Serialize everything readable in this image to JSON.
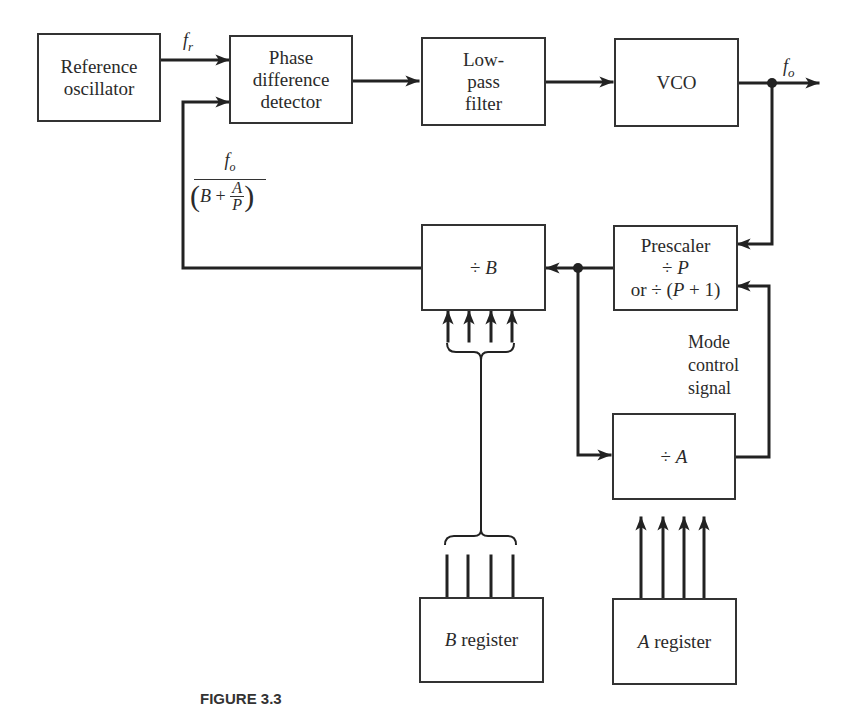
{
  "diagram": {
    "type": "block-diagram",
    "blocks": {
      "reference_oscillator": {
        "label_line1": "Reference",
        "label_line2": "oscillator"
      },
      "phase_detector": {
        "label_line1": "Phase",
        "label_line2": "difference",
        "label_line3": "detector"
      },
      "low_pass_filter": {
        "label_line1": "Low-",
        "label_line2": "pass",
        "label_line3": "filter"
      },
      "vco": {
        "label": "VCO"
      },
      "prescaler": {
        "label_line1": "Prescaler",
        "label_line2_op": "÷",
        "label_line2_var": "P",
        "label_line3_prefix": "or ÷ (",
        "label_line3_var": "P",
        "label_line3_suffix": " + 1)"
      },
      "divide_b": {
        "op": "÷",
        "var": "B"
      },
      "divide_a": {
        "op": "÷",
        "var": "A"
      },
      "b_register": {
        "var": "B",
        "text": " register"
      },
      "a_register": {
        "var": "A",
        "text": " register"
      }
    },
    "signals": {
      "reference_freq": {
        "symbol": "f",
        "subscript": "r"
      },
      "output_freq": {
        "symbol": "f",
        "subscript": "o"
      },
      "feedback": {
        "numerator_symbol": "f",
        "numerator_subscript": "o",
        "denominator_open": "(",
        "denominator_b": "B",
        "denominator_plus": " + ",
        "denominator_a": "A",
        "denominator_p": "P",
        "denominator_close": ")"
      },
      "mode_control": {
        "line1": "Mode",
        "line2": "control",
        "line3": "signal"
      }
    },
    "caption": "FIGURE 3.3"
  }
}
